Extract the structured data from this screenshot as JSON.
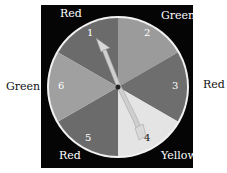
{
  "spinner": {
    "sectors": [
      {
        "number": "1",
        "color_name": "Red",
        "fill": "#6b6b6b"
      },
      {
        "number": "2",
        "color_name": "Green",
        "fill": "#9b9b9b"
      },
      {
        "number": "3",
        "color_name": "Red",
        "fill": "#6e6e6e"
      },
      {
        "number": "4",
        "color_name": "Yellow",
        "fill": "#e4e4e4"
      },
      {
        "number": "5",
        "color_name": "Red",
        "fill": "#6b6b6b"
      },
      {
        "number": "6",
        "color_name": "Green",
        "fill": "#a0a0a0"
      }
    ],
    "pointer_points_to": "1",
    "outer_labels": {
      "top_left": "Red",
      "top_right": "Green",
      "left": "Green",
      "right": "Red",
      "bottom_left": "Red",
      "bottom_right": "Yellow"
    }
  }
}
